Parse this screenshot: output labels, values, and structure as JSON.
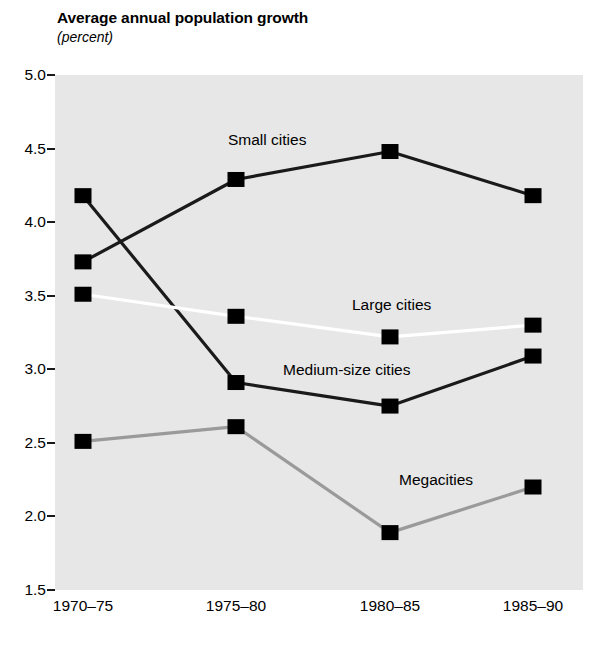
{
  "chart_data": {
    "type": "line",
    "title": "Average annual population growth",
    "subtitle": "(percent)",
    "xlabel": "",
    "ylabel": "",
    "categories": [
      "1970–75",
      "1975–80",
      "1980–85",
      "1985–90"
    ],
    "ylim": [
      1.5,
      5.0
    ],
    "yticks": [
      "5.0",
      "4.5",
      "4.0",
      "3.5",
      "3.0",
      "2.5",
      "2.0",
      "1.5"
    ],
    "ytick_values": [
      5.0,
      4.5,
      4.0,
      3.5,
      3.0,
      2.5,
      2.0,
      1.5
    ],
    "grid": false,
    "legend_position": "inline-annotations",
    "plot_background": "#e7e7e7",
    "marker": "square",
    "series": [
      {
        "name": "Small cities",
        "values": [
          3.73,
          4.29,
          4.48,
          4.18
        ],
        "color": "#1a1a1a",
        "marker_color": "#000000"
      },
      {
        "name": "Medium-size cities",
        "values": [
          4.18,
          2.91,
          2.75,
          3.09
        ],
        "color": "#1a1a1a",
        "marker_color": "#000000"
      },
      {
        "name": "Large cities",
        "values": [
          3.51,
          3.36,
          3.22,
          3.3
        ],
        "color": "#ffffff",
        "marker_color": "#000000"
      },
      {
        "name": "Megacities",
        "values": [
          2.51,
          2.61,
          1.89,
          2.2
        ],
        "color": "#9a9a9a",
        "marker_color": "#000000"
      }
    ],
    "annotations": [
      {
        "text": "Small cities",
        "series": "Small cities"
      },
      {
        "text": "Large cities",
        "series": "Large cities"
      },
      {
        "text": "Medium-size cities",
        "series": "Medium-size cities"
      },
      {
        "text": "Megacities",
        "series": "Megacities"
      }
    ]
  }
}
